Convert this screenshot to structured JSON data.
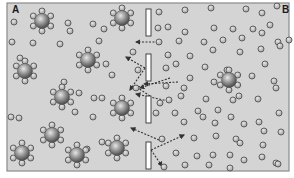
{
  "diagram": {
    "type": "osmosis-membrane",
    "labels": {
      "left": "A",
      "right": "B"
    },
    "colors": {
      "background": "#d4d4d4",
      "frame": "#8a8a8a",
      "membrane_fill": "#ffffff",
      "membrane_stroke": "#333333",
      "water_fill": "#bdbdbd",
      "water_stroke": "#555555",
      "solute_fill": "#8f8f8f",
      "arrow": "#333333"
    },
    "frame": {
      "x": 7,
      "y": 3,
      "w": 282,
      "h": 168
    },
    "membrane_segments": [
      {
        "x": 146,
        "y": 9,
        "w": 5,
        "h": 27
      },
      {
        "x": 146,
        "y": 54,
        "w": 5,
        "h": 27
      },
      {
        "x": 146,
        "y": 96,
        "w": 5,
        "h": 27
      },
      {
        "x": 146,
        "y": 142,
        "w": 5,
        "h": 27
      }
    ],
    "solutes": [
      [
        42,
        21
      ],
      [
        122,
        18
      ],
      [
        88,
        60
      ],
      [
        25,
        71
      ],
      [
        62,
        97
      ],
      [
        122,
        108
      ],
      [
        52,
        135
      ],
      [
        22,
        153
      ],
      [
        77,
        155
      ],
      [
        117,
        148
      ],
      [
        229,
        80
      ]
    ],
    "water": [
      [
        14,
        22
      ],
      [
        68,
        23
      ],
      [
        70,
        31
      ],
      [
        33,
        43
      ],
      [
        93,
        24
      ],
      [
        104,
        29
      ],
      [
        12,
        42
      ],
      [
        91,
        63
      ],
      [
        20,
        58
      ],
      [
        27,
        73
      ],
      [
        112,
        75
      ],
      [
        106,
        64
      ],
      [
        60,
        44
      ],
      [
        64,
        82
      ],
      [
        99,
        41
      ],
      [
        79,
        93
      ],
      [
        102,
        98
      ],
      [
        93,
        117
      ],
      [
        94,
        98
      ],
      [
        75,
        112
      ],
      [
        11,
        117
      ],
      [
        19,
        118
      ],
      [
        87,
        149
      ],
      [
        102,
        142
      ],
      [
        133,
        52
      ],
      [
        138,
        70
      ],
      [
        136,
        88
      ],
      [
        159,
        12
      ],
      [
        185,
        10
      ],
      [
        211,
        8
      ],
      [
        246,
        9
      ],
      [
        262,
        13
      ],
      [
        277,
        6
      ],
      [
        158,
        28
      ],
      [
        168,
        27
      ],
      [
        185,
        32
      ],
      [
        214,
        28
      ],
      [
        233,
        29
      ],
      [
        253,
        29
      ],
      [
        270,
        25
      ],
      [
        278,
        42
      ],
      [
        159,
        42
      ],
      [
        179,
        41
      ],
      [
        204,
        42
      ],
      [
        223,
        40
      ],
      [
        242,
        38
      ],
      [
        262,
        33
      ],
      [
        289,
        40
      ],
      [
        168,
        55
      ],
      [
        190,
        56
      ],
      [
        213,
        50
      ],
      [
        240,
        52
      ],
      [
        261,
        49
      ],
      [
        280,
        46
      ],
      [
        166,
        68
      ],
      [
        176,
        64
      ],
      [
        190,
        78
      ],
      [
        166,
        86
      ],
      [
        205,
        67
      ],
      [
        214,
        82
      ],
      [
        227,
        70
      ],
      [
        252,
        76
      ],
      [
        265,
        64
      ],
      [
        274,
        81
      ],
      [
        169,
        100
      ],
      [
        181,
        96
      ],
      [
        206,
        99
      ],
      [
        218,
        110
      ],
      [
        233,
        100
      ],
      [
        239,
        96
      ],
      [
        258,
        99
      ],
      [
        276,
        88
      ],
      [
        160,
        103
      ],
      [
        156,
        113
      ],
      [
        175,
        113
      ],
      [
        184,
        122
      ],
      [
        203,
        117
      ],
      [
        215,
        123
      ],
      [
        231,
        117
      ],
      [
        244,
        124
      ],
      [
        259,
        122
      ],
      [
        279,
        113
      ],
      [
        162,
        139
      ],
      [
        194,
        138
      ],
      [
        216,
        136
      ],
      [
        236,
        139
      ],
      [
        264,
        131
      ],
      [
        281,
        132
      ],
      [
        176,
        153
      ],
      [
        197,
        156
      ],
      [
        213,
        155
      ],
      [
        230,
        155
      ],
      [
        244,
        160
      ],
      [
        262,
        157
      ],
      [
        276,
        163
      ],
      [
        164,
        167
      ],
      [
        185,
        165
      ],
      [
        209,
        165
      ],
      [
        230,
        168
      ],
      [
        278,
        164
      ],
      [
        184,
        88
      ],
      [
        198,
        111
      ],
      [
        240,
        143
      ],
      [
        263,
        145
      ]
    ],
    "arrows": [
      {
        "from": [
          158,
          42
        ],
        "to": [
          136,
          42
        ]
      },
      {
        "from": [
          145,
          68
        ],
        "to": [
          126,
          57
        ]
      },
      {
        "from": [
          145,
          68
        ],
        "to": [
          130,
          90
        ]
      },
      {
        "from": [
          170,
          78
        ],
        "to": [
          140,
          88
        ]
      },
      {
        "from": [
          178,
          82
        ],
        "to": [
          144,
          84
        ]
      },
      {
        "from": [
          150,
          96
        ],
        "to": [
          135,
          86
        ]
      },
      {
        "from": [
          168,
          101
        ],
        "to": [
          136,
          94
        ]
      },
      {
        "from": [
          159,
          140
        ],
        "to": [
          131,
          128
        ]
      },
      {
        "from": [
          151,
          150
        ],
        "to": [
          184,
          135
        ]
      },
      {
        "from": [
          151,
          150
        ],
        "to": [
          162,
          166
        ]
      }
    ]
  }
}
